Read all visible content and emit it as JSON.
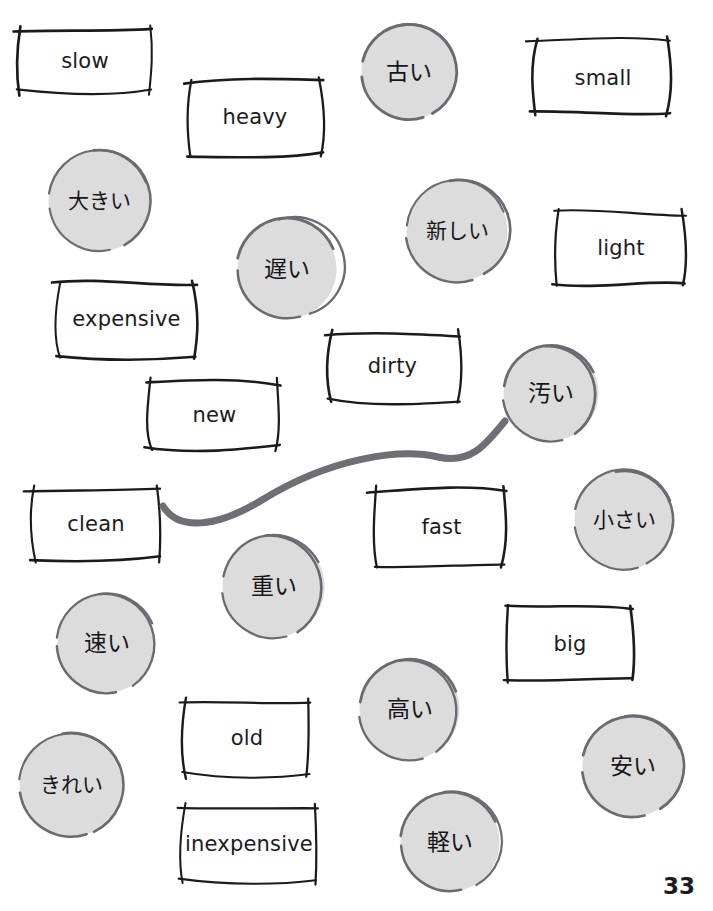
{
  "page": {
    "number": "33",
    "background_color": "#ffffff",
    "ink_color": "#1b1b1e",
    "chip_fill": "#dcdcdc",
    "chip_stroke": "#6a6a72",
    "connector_color": "#6e6e74"
  },
  "cards": [
    {
      "id": "slow",
      "label": "slow",
      "x": 18,
      "y": 26,
      "w": 134,
      "h": 70
    },
    {
      "id": "heavy",
      "label": "heavy",
      "x": 188,
      "y": 78,
      "w": 134,
      "h": 78
    },
    {
      "id": "small",
      "label": "small",
      "x": 534,
      "y": 40,
      "w": 138,
      "h": 77
    },
    {
      "id": "light",
      "label": "light",
      "x": 556,
      "y": 208,
      "w": 130,
      "h": 80
    },
    {
      "id": "expensive",
      "label": "expensive",
      "x": 58,
      "y": 280,
      "w": 137,
      "h": 78
    },
    {
      "id": "dirty",
      "label": "dirty",
      "x": 326,
      "y": 330,
      "w": 133,
      "h": 72
    },
    {
      "id": "new",
      "label": "new",
      "x": 148,
      "y": 379,
      "w": 133,
      "h": 73
    },
    {
      "id": "clean",
      "label": "clean",
      "x": 33,
      "y": 487,
      "w": 126,
      "h": 74
    },
    {
      "id": "fast",
      "label": "fast",
      "x": 376,
      "y": 488,
      "w": 131,
      "h": 79
    },
    {
      "id": "big",
      "label": "big",
      "x": 505,
      "y": 606,
      "w": 130,
      "h": 76
    },
    {
      "id": "old",
      "label": "old",
      "x": 183,
      "y": 699,
      "w": 128,
      "h": 79
    },
    {
      "id": "inexpensive",
      "label": "inexpensive",
      "x": 180,
      "y": 805,
      "w": 138,
      "h": 79
    }
  ],
  "chips": [
    {
      "id": "furui",
      "label": "古い",
      "x": 359,
      "y": 22,
      "d": 100,
      "size": "lg"
    },
    {
      "id": "ookii",
      "label": "大きい",
      "x": 46,
      "y": 148,
      "d": 106,
      "size": "sm"
    },
    {
      "id": "atarashii",
      "label": "新しい",
      "x": 404,
      "y": 178,
      "d": 106,
      "size": "sm"
    },
    {
      "id": "osoi",
      "label": "遅い",
      "x": 235,
      "y": 217,
      "d": 104,
      "size": "lg"
    },
    {
      "id": "kitanai",
      "label": "汚い",
      "x": 501,
      "y": 343,
      "d": 100,
      "size": "lg"
    },
    {
      "id": "chiisai",
      "label": "小さい",
      "x": 572,
      "y": 468,
      "d": 104,
      "size": "sm"
    },
    {
      "id": "omoi",
      "label": "重い",
      "x": 220,
      "y": 533,
      "d": 107,
      "size": "lg"
    },
    {
      "id": "hayai",
      "label": "速い",
      "x": 55,
      "y": 592,
      "d": 103,
      "size": "lg"
    },
    {
      "id": "takai",
      "label": "高い",
      "x": 357,
      "y": 657,
      "d": 105,
      "size": "lg"
    },
    {
      "id": "kirei",
      "label": "きれい",
      "x": 17,
      "y": 731,
      "d": 108,
      "size": "sm"
    },
    {
      "id": "yasui",
      "label": "安い",
      "x": 580,
      "y": 714,
      "d": 105,
      "size": "lg"
    },
    {
      "id": "karui",
      "label": "軽い",
      "x": 398,
      "y": 790,
      "d": 104,
      "size": "lg"
    }
  ],
  "connector": {
    "from": "clean",
    "to": "kitanai",
    "path": "M 163 506 C 178 531, 216 528, 262 500 C 330 458, 400 448, 438 457 C 470 464, 485 446, 505 421"
  }
}
